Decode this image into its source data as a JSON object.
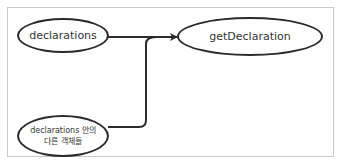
{
  "diagram": {
    "nodes": [
      {
        "id": "declarations",
        "label": "declarations"
      },
      {
        "id": "getDeclaration",
        "label": "getDeclaration"
      },
      {
        "id": "other-objects",
        "label_line1": "declarations 안의",
        "label_line2": "다른 객체들"
      }
    ],
    "edges": [
      {
        "from": "declarations",
        "to": "getDeclaration",
        "style": "arrow"
      },
      {
        "from": "other-objects",
        "to": "getDeclaration",
        "style": "merged-connector"
      }
    ],
    "colors": {
      "stroke": "#2b2b2b",
      "frame": "#c8c8c8",
      "text": "#333333"
    }
  }
}
